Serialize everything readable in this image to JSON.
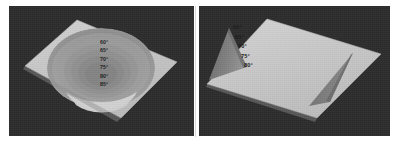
{
  "figure": {
    "background_color": "#ffffff",
    "panel_background_color": "#2d2d2d",
    "divider_color": "#d8d8d6",
    "plate_color": "#c8c8c8",
    "label_color": "#1c1c1c"
  },
  "panels": [
    {
      "id": "left",
      "name": "bowl-surface-plot",
      "surface_type": "circular-basin",
      "plate_color": "#c8c8c8",
      "contour_colors": [
        "#b0b0b0",
        "#a4a4a4",
        "#9a9a9a",
        "#929292",
        "#8c8c8c",
        "#868686",
        "#828282"
      ],
      "cap_color": "#d4d4d4",
      "labels": [
        {
          "text": "60°"
        },
        {
          "text": "65°"
        },
        {
          "text": "70°"
        },
        {
          "text": "75°"
        },
        {
          "text": "80°"
        },
        {
          "text": "85°"
        }
      ]
    },
    {
      "id": "right",
      "name": "wedge-trough-surface-plot",
      "surface_type": "v-groove-trough",
      "plate_color": "#c9c9c9",
      "trough_colors": [
        "#8e8e8e",
        "#7e7e7e",
        "#6e6e6e",
        "#606060"
      ],
      "labels": [
        {
          "text": "60°"
        },
        {
          "text": "65°"
        },
        {
          "text": "70°"
        },
        {
          "text": "75°"
        },
        {
          "text": "80°"
        }
      ]
    }
  ]
}
